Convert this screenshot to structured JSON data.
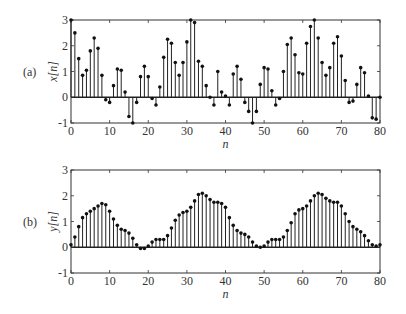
{
  "chart_data": [
    {
      "type": "stem",
      "panel_label": "(a)",
      "title": "",
      "xlabel": "n",
      "ylabel": "x[n]",
      "xlim": [
        0,
        80
      ],
      "ylim": [
        -1,
        3
      ],
      "xticks": [
        0,
        10,
        20,
        30,
        40,
        50,
        60,
        70,
        80
      ],
      "yticks": [
        -1,
        0,
        1,
        2,
        3
      ],
      "grid": false,
      "x": [
        0,
        1,
        2,
        3,
        4,
        5,
        6,
        7,
        8,
        9,
        10,
        11,
        12,
        13,
        14,
        15,
        16,
        17,
        18,
        19,
        20,
        21,
        22,
        23,
        24,
        25,
        26,
        27,
        28,
        29,
        30,
        31,
        32,
        33,
        34,
        35,
        36,
        37,
        38,
        39,
        40,
        41,
        42,
        43,
        44,
        45,
        46,
        47,
        48,
        49,
        50,
        51,
        52,
        53,
        54,
        55,
        56,
        57,
        58,
        59,
        60,
        61,
        62,
        63,
        64,
        65,
        66,
        67,
        68,
        69,
        70,
        71,
        72,
        73,
        74,
        75,
        76,
        77,
        78,
        79,
        80
      ],
      "values": [
        3.0,
        2.5,
        1.5,
        0.85,
        1.05,
        1.8,
        2.3,
        1.9,
        0.85,
        -0.1,
        -0.2,
        0.45,
        1.1,
        1.05,
        0.2,
        -0.75,
        -1.0,
        -0.2,
        0.8,
        1.2,
        0.8,
        -0.05,
        -0.3,
        0.4,
        1.55,
        2.25,
        2.1,
        1.35,
        0.85,
        1.35,
        2.15,
        3.0,
        2.9,
        1.4,
        1.2,
        0.45,
        0.0,
        -0.3,
        1.0,
        0.2,
        0.05,
        -0.3,
        0.9,
        1.2,
        0.7,
        -0.2,
        -0.55,
        -1.0,
        -0.55,
        0.5,
        1.15,
        1.1,
        0.25,
        -0.3,
        -0.05,
        1.0,
        2.05,
        2.3,
        1.65,
        0.95,
        0.9,
        2.1,
        2.75,
        3.0,
        2.3,
        1.35,
        0.85,
        1.15,
        2.1,
        2.35,
        1.6,
        0.65,
        -0.2,
        -0.15,
        0.5,
        1.15,
        0.95,
        0.05,
        -0.8,
        -0.85,
        0.0
      ]
    },
    {
      "type": "stem",
      "panel_label": "(b)",
      "title": "",
      "xlabel": "n",
      "ylabel": "y[n]",
      "xlim": [
        0,
        80
      ],
      "ylim": [
        -1,
        3
      ],
      "xticks": [
        0,
        10,
        20,
        30,
        40,
        50,
        60,
        70,
        80
      ],
      "yticks": [
        -1,
        0,
        1,
        2,
        3
      ],
      "grid": false,
      "x": [
        0,
        1,
        2,
        3,
        4,
        5,
        6,
        7,
        8,
        9,
        10,
        11,
        12,
        13,
        14,
        15,
        16,
        17,
        18,
        19,
        20,
        21,
        22,
        23,
        24,
        25,
        26,
        27,
        28,
        29,
        30,
        31,
        32,
        33,
        34,
        35,
        36,
        37,
        38,
        39,
        40,
        41,
        42,
        43,
        44,
        45,
        46,
        47,
        48,
        49,
        50,
        51,
        52,
        53,
        54,
        55,
        56,
        57,
        58,
        59,
        60,
        61,
        62,
        63,
        64,
        65,
        66,
        67,
        68,
        69,
        70,
        71,
        72,
        73,
        74,
        75,
        76,
        77,
        78,
        79,
        80
      ],
      "values": [
        0.1,
        0.4,
        0.8,
        1.15,
        1.3,
        1.4,
        1.5,
        1.6,
        1.7,
        1.65,
        1.4,
        1.1,
        0.85,
        0.7,
        0.65,
        0.55,
        0.35,
        0.1,
        -0.05,
        -0.05,
        0.05,
        0.2,
        0.3,
        0.3,
        0.3,
        0.45,
        0.75,
        1.05,
        1.25,
        1.35,
        1.4,
        1.55,
        1.8,
        2.05,
        2.1,
        2.0,
        1.85,
        1.75,
        1.75,
        1.7,
        1.55,
        1.15,
        0.85,
        0.65,
        0.55,
        0.5,
        0.4,
        0.2,
        0.05,
        0.0,
        0.05,
        0.2,
        0.3,
        0.3,
        0.3,
        0.4,
        0.65,
        0.95,
        1.3,
        1.45,
        1.5,
        1.6,
        1.8,
        2.0,
        2.1,
        2.05,
        1.9,
        1.8,
        1.75,
        1.75,
        1.6,
        1.3,
        1.0,
        0.8,
        0.7,
        0.6,
        0.45,
        0.25,
        0.1,
        0.05,
        0.1
      ]
    }
  ]
}
